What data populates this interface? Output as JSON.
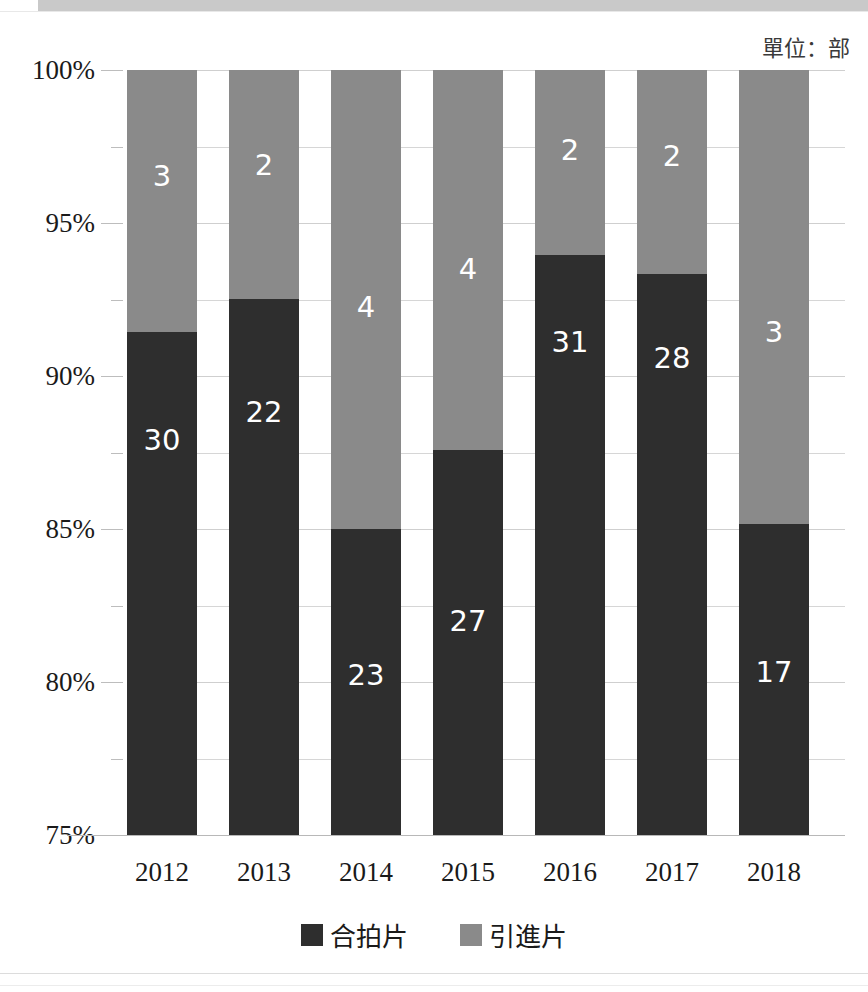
{
  "unit_label": "單位：部",
  "colors": {
    "dark": "#2e2e2e",
    "light": "#8a8a8a",
    "grid": "#d6d6d6",
    "band": "#c9c9c9",
    "text": "#1a1a1a",
    "label_text": "#ffffff"
  },
  "axis": {
    "y_ticks": [
      "100%",
      "95%",
      "90%",
      "85%",
      "80%",
      "75%"
    ],
    "y_values": [
      100,
      95,
      90,
      85,
      80,
      75
    ],
    "y_minor_values": [
      97.5,
      92.5,
      87.5,
      82.5,
      77.5
    ],
    "ylim": [
      75,
      100
    ]
  },
  "legend": {
    "items": [
      {
        "label": "合拍片",
        "color": "#2e2e2e"
      },
      {
        "label": "引進片",
        "color": "#8a8a8a"
      }
    ]
  },
  "chart_data": {
    "type": "bar",
    "stacked": true,
    "percent_stacked": true,
    "title": "",
    "subtitle": "",
    "xlabel": "",
    "ylabel": "",
    "unit": "單位：部",
    "ylim": [
      75,
      100
    ],
    "ytick_labels": [
      "75%",
      "80%",
      "85%",
      "90%",
      "95%",
      "100%"
    ],
    "grid": true,
    "legend_position": "bottom",
    "categories": [
      "2012",
      "2013",
      "2014",
      "2015",
      "2016",
      "2017",
      "2018"
    ],
    "series": [
      {
        "name": "合拍片",
        "color": "#2e2e2e",
        "values": [
          30,
          22,
          23,
          27,
          31,
          28,
          17
        ],
        "percent": [
          91.43,
          92.52,
          85.0,
          87.58,
          93.94,
          93.33,
          85.15
        ]
      },
      {
        "name": "引進片",
        "color": "#8a8a8a",
        "values": [
          3,
          2,
          4,
          4,
          2,
          2,
          3
        ],
        "percent": [
          8.57,
          7.48,
          15.0,
          12.42,
          6.06,
          6.67,
          14.85
        ]
      }
    ]
  }
}
